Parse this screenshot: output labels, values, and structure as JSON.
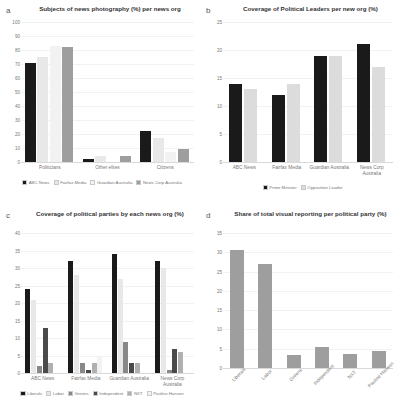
{
  "figure": {
    "panels": [
      "a",
      "b",
      "c",
      "d"
    ]
  },
  "chart_data": [
    {
      "panel": "a",
      "type": "bar",
      "title": "Subjects of news photography (%) per news org",
      "xlabel": "",
      "ylabel": "",
      "ylim": [
        0,
        100
      ],
      "yticks": [
        0,
        10,
        20,
        30,
        40,
        50,
        60,
        70,
        80,
        90,
        100
      ],
      "categories": [
        "Politicians",
        "Other elites",
        "Citizens"
      ],
      "legend_position": "bottom",
      "grid": false,
      "series": [
        {
          "name": "ABC News",
          "color": "#1a1a1a",
          "values": [
            71,
            2,
            22
          ]
        },
        {
          "name": "Fairfax Media",
          "color": "#e8e8e8",
          "values": [
            75,
            4,
            17
          ]
        },
        {
          "name": "Guardian Australia",
          "color": "#f2f2f2",
          "values": [
            83,
            0,
            7
          ]
        },
        {
          "name": "News Corp Australia",
          "color": "#9e9e9e",
          "values": [
            82,
            4,
            9
          ]
        }
      ]
    },
    {
      "panel": "b",
      "type": "bar",
      "title": "Coverage of Political Leaders per new org (%)",
      "xlabel": "",
      "ylabel": "",
      "ylim": [
        0,
        25
      ],
      "yticks": [
        0,
        5,
        10,
        15,
        20,
        25
      ],
      "categories": [
        "ABC News",
        "Fairfax Media",
        "Guardian Australia",
        "News Corp Australia"
      ],
      "legend_position": "bottom",
      "grid": false,
      "series": [
        {
          "name": "Prime Minister",
          "color": "#1a1a1a",
          "values": [
            14,
            12,
            19,
            21
          ]
        },
        {
          "name": "Opposition Leader",
          "color": "#dcdcdc",
          "values": [
            13,
            14,
            19,
            17
          ]
        }
      ]
    },
    {
      "panel": "c",
      "type": "bar",
      "title": "Coverage of political parties by each news org (%)",
      "xlabel": "",
      "ylabel": "",
      "ylim": [
        0,
        40
      ],
      "yticks": [
        0,
        5,
        10,
        15,
        20,
        25,
        30,
        35,
        40
      ],
      "categories": [
        "ABC News",
        "Fairfax Media",
        "Guardian Australia",
        "News Corp Australia"
      ],
      "legend_position": "bottom",
      "grid": false,
      "series": [
        {
          "name": "Liberals",
          "color": "#1a1a1a",
          "values": [
            24,
            32,
            34,
            32
          ]
        },
        {
          "name": "Labor",
          "color": "#e8e8e8",
          "values": [
            21,
            28,
            27,
            30
          ]
        },
        {
          "name": "Greens",
          "color": "#888888",
          "values": [
            2,
            3,
            9,
            1
          ]
        },
        {
          "name": "Independent",
          "color": "#4a4a4a",
          "values": [
            13,
            1,
            3,
            7
          ]
        },
        {
          "name": "NXT",
          "color": "#b0b0b0",
          "values": [
            3,
            3,
            3,
            6
          ]
        },
        {
          "name": "Pauline Hanson",
          "color": "#f2f2f2",
          "values": [
            0,
            5,
            0,
            0
          ]
        }
      ]
    },
    {
      "panel": "d",
      "type": "bar",
      "title": "Share of total visual reporting per political party (%)",
      "xlabel": "",
      "ylabel": "",
      "ylim": [
        0,
        35
      ],
      "yticks": [
        0,
        5,
        10,
        15,
        20,
        25,
        30,
        35
      ],
      "categories": [
        "Liberals",
        "Labor",
        "Greens",
        "Independent",
        "NXT",
        "Pauline Hanson"
      ],
      "legend_position": "none",
      "grid": false,
      "series": [
        {
          "name": "Share",
          "color": "#9e9e9e",
          "values": [
            30.5,
            27,
            3.5,
            5.5,
            3.7,
            4.5
          ]
        }
      ]
    }
  ]
}
